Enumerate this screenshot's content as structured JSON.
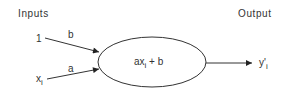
{
  "diagram": {
    "inputs_header": "Inputs",
    "output_header": "Output",
    "input_one": "1",
    "input_x": "x",
    "input_x_sub": "i",
    "weight_b": "b",
    "weight_a": "a",
    "node_expr_prefix": "ax",
    "node_expr_sub": "i",
    "node_expr_suffix": " + b",
    "output_y": "y'",
    "output_y_sub": "i",
    "colors": {
      "stroke": "#333333",
      "text": "#333333",
      "background": "#ffffff"
    }
  }
}
